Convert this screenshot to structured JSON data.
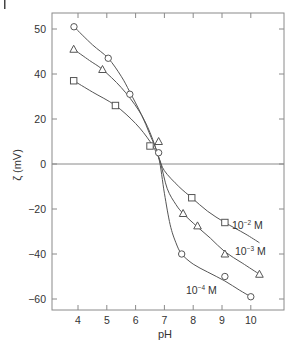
{
  "chart_data": {
    "type": "scatter",
    "title": "",
    "xlabel": "pH",
    "ylabel": "ζ (mV)",
    "xlim": [
      3.1,
      11.1
    ],
    "ylim": [
      -65,
      67
    ],
    "grid": false,
    "legend_position": "inline labels near curves",
    "x_ticks": [
      4,
      5,
      6,
      7,
      8,
      9,
      10
    ],
    "y_ticks": [
      {
        "value": 60,
        "label": "50"
      },
      {
        "value": 40,
        "label": "40"
      },
      {
        "value": 20,
        "label": "20"
      },
      {
        "value": 0,
        "label": "0"
      },
      {
        "value": -20,
        "label": "-20"
      },
      {
        "value": -40,
        "label": "-40"
      },
      {
        "value": -60,
        "label": "-60"
      }
    ],
    "zero_line": true,
    "series": [
      {
        "name": "10^-2 M",
        "label_text": "10",
        "label_exp": "-2",
        "label_unit": " M",
        "marker": "square",
        "x": [
          3.85,
          5.3,
          6.5,
          7.95,
          9.1
        ],
        "y": [
          37,
          26,
          8,
          -15,
          -26
        ],
        "curve": [
          [
            3.85,
            37
          ],
          [
            4.5,
            32
          ],
          [
            5.3,
            26
          ],
          [
            6.0,
            18
          ],
          [
            6.5,
            10
          ],
          [
            6.8,
            3
          ],
          [
            7.0,
            -3
          ],
          [
            7.5,
            -10
          ],
          [
            7.95,
            -15
          ],
          [
            8.5,
            -21
          ],
          [
            9.1,
            -26
          ],
          [
            9.8,
            -31
          ],
          [
            10.3,
            -35
          ]
        ]
      },
      {
        "name": "10^-3 M",
        "label_text": "10",
        "label_exp": "-3",
        "label_unit": " M",
        "marker": "triangle",
        "x": [
          3.85,
          4.85,
          6.8,
          7.65,
          8.15,
          9.1,
          10.3
        ],
        "y": [
          51,
          42,
          10,
          -22,
          -27.5,
          -40,
          -49
        ],
        "curve": [
          [
            3.85,
            51
          ],
          [
            4.4,
            46
          ],
          [
            4.85,
            42
          ],
          [
            5.5,
            34
          ],
          [
            6.1,
            24
          ],
          [
            6.5,
            14
          ],
          [
            6.85,
            1
          ],
          [
            7.1,
            -11
          ],
          [
            7.4,
            -18
          ],
          [
            7.65,
            -22
          ],
          [
            8.15,
            -28
          ],
          [
            8.6,
            -33
          ],
          [
            9.1,
            -39
          ],
          [
            9.7,
            -44
          ],
          [
            10.3,
            -49
          ]
        ]
      },
      {
        "name": "10^-4 M",
        "label_text": "10",
        "label_exp": "-4",
        "label_unit": " M",
        "marker": "circle",
        "x": [
          3.86,
          5.05,
          5.8,
          6.8,
          7.6,
          9.1,
          10.0
        ],
        "y": [
          61,
          47,
          31,
          5,
          -40,
          -50,
          -59
        ],
        "curve": [
          [
            3.86,
            61
          ],
          [
            4.5,
            53
          ],
          [
            5.05,
            47
          ],
          [
            5.5,
            39
          ],
          [
            5.8,
            32
          ],
          [
            6.2,
            22
          ],
          [
            6.5,
            13
          ],
          [
            6.8,
            3
          ],
          [
            7.0,
            -13
          ],
          [
            7.2,
            -27
          ],
          [
            7.4,
            -35
          ],
          [
            7.6,
            -40
          ],
          [
            8.0,
            -44.5
          ],
          [
            8.5,
            -48
          ],
          [
            9.1,
            -52
          ],
          [
            9.6,
            -56
          ],
          [
            10.0,
            -59
          ]
        ]
      }
    ]
  },
  "labels": {
    "xlabel": "pH",
    "ylabel": "ζ (mV)",
    "series_10_2": "10",
    "series_10_2_exp": "−2",
    "series_10_3": "10",
    "series_10_3_exp": "−3",
    "series_10_4": "10",
    "series_10_4_exp": "−4",
    "unit": " M"
  }
}
